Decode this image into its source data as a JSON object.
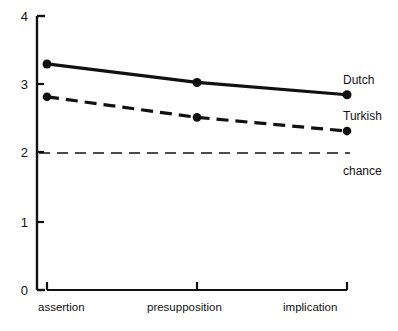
{
  "chart_data": {
    "type": "line",
    "title": "",
    "xlabel": "",
    "ylabel": "",
    "categories": [
      "assertion",
      "presupposition",
      "implication"
    ],
    "ylim": [
      0,
      4
    ],
    "yticks": [
      0,
      1,
      2,
      3,
      4
    ],
    "ytick_labels": [
      "0",
      "1",
      "2",
      "3",
      "4"
    ],
    "grid": false,
    "legend_position": "right-inline",
    "series": [
      {
        "name": "Dutch",
        "style": "solid",
        "marker": "filled-circle",
        "values": [
          3.3,
          3.03,
          2.85
        ]
      },
      {
        "name": "Turkish",
        "style": "dashed",
        "marker": "filled-circle",
        "values": [
          2.82,
          2.52,
          2.32
        ]
      },
      {
        "name": "chance",
        "style": "long-dashed",
        "marker": "none",
        "values": [
          2.0,
          2.0,
          2.0
        ]
      }
    ],
    "annotations": [
      {
        "text": "Dutch",
        "series": "Dutch"
      },
      {
        "text": "Turkish",
        "series": "Turkish"
      },
      {
        "text": "chance",
        "series": "chance"
      }
    ]
  },
  "axis": {
    "y_tick_0": "0",
    "y_tick_1": "1",
    "y_tick_2": "2",
    "y_tick_3": "3",
    "y_tick_4": "4",
    "x_cat_0": "assertion",
    "x_cat_1": "presupposition",
    "x_cat_2": "implication"
  },
  "labels": {
    "dutch": "Dutch",
    "turkish": "Turkish",
    "chance": "chance"
  },
  "colors": {
    "ink": "#111111",
    "background": "#ffffff"
  }
}
